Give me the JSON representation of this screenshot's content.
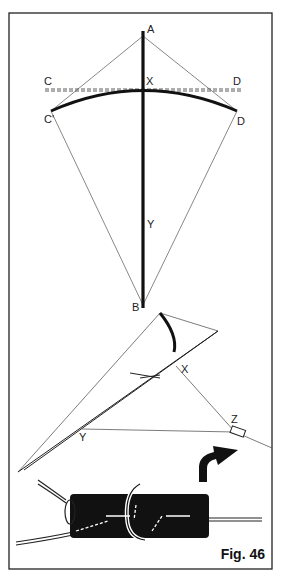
{
  "figure": {
    "caption": "Fig. 46",
    "frame_color": "#222222",
    "ink_color": "#111111"
  },
  "top_view": {
    "labels": {
      "A": "A",
      "X": "X",
      "C": "C",
      "D": "D",
      "C_prime": "C'",
      "D_prime": "D",
      "Y": "Y",
      "B": "B"
    }
  },
  "side_view": {
    "labels": {
      "B": "B",
      "X": "X",
      "Y": "Y",
      "Z": "Z"
    }
  }
}
